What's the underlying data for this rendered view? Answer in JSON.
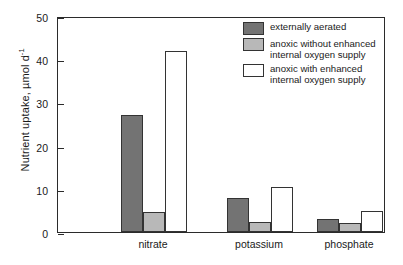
{
  "chart_data": {
    "type": "bar",
    "title": "",
    "xlabel": "",
    "ylabel": "Nutrient uptake, µmol d",
    "ylabel_exponent": "-1",
    "ylim": [
      0,
      50
    ],
    "yticks": [
      0,
      10,
      20,
      30,
      40,
      50
    ],
    "ytick_labels": [
      "0",
      "10",
      "20",
      "30",
      "40",
      "50"
    ],
    "grid": false,
    "legend_position": "top-right",
    "categories": [
      "nitrate",
      "potassium",
      "phosphate"
    ],
    "series": [
      {
        "name": "externally aerated",
        "color": "#737373",
        "edge_color": "#333333",
        "values": [
          27.0,
          7.9,
          2.9
        ]
      },
      {
        "name": "anoxic without enhanced\ninternal oxygen supply",
        "color": "#b8b8b8",
        "edge_color": "#333333",
        "values": [
          4.7,
          2.4,
          2.0
        ]
      },
      {
        "name": "anoxic with enhanced\ninternal oxygen supply",
        "color": "#ffffff",
        "edge_color": "#333333",
        "values": [
          42.0,
          10.4,
          4.8
        ]
      }
    ]
  },
  "axis": {
    "frame_color": "#2b2b2b"
  }
}
